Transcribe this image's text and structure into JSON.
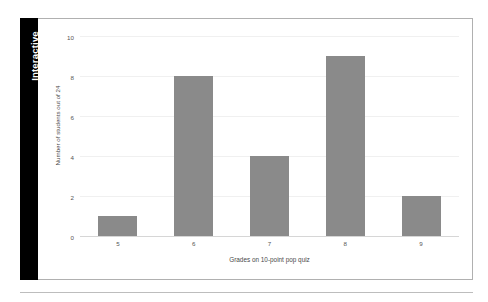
{
  "tab": {
    "label": "Interactive"
  },
  "chart_data": {
    "type": "bar",
    "title": "",
    "subtitle": "",
    "xlabel": "Grades on 10-point pop quiz",
    "ylabel": "Number of students out of 24",
    "categories": [
      "5",
      "6",
      "7",
      "8",
      "9"
    ],
    "values": [
      1,
      8,
      4,
      9,
      2
    ],
    "series": [
      {
        "name": "Number of students",
        "values": [
          1,
          8,
          4,
          9,
          2
        ]
      }
    ],
    "ylim": [
      0,
      10
    ],
    "yticks": [
      0,
      2,
      4,
      6,
      8,
      10
    ],
    "ytick_labels": [
      "0",
      "2",
      "4",
      "6",
      "8",
      "10"
    ],
    "grid": true,
    "grid_axis": "y",
    "legend": false,
    "legend_position": "none",
    "bar_color": "#8a8a8a",
    "background_color": "#ffffff",
    "gridline_color": "#f0f0f0",
    "axis_color": "#d6d6d6",
    "text_color": "#555555"
  }
}
